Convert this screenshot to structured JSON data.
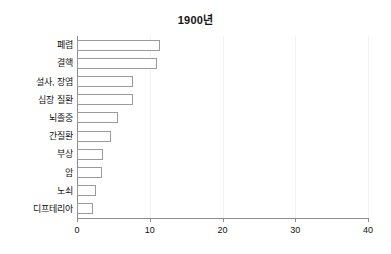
{
  "chart_data": {
    "type": "bar",
    "orientation": "horizontal",
    "title": "1900년",
    "xlabel": "",
    "ylabel": "",
    "categories": [
      "폐렴",
      "결핵",
      "설사, 장염",
      "심장 질환",
      "뇌졸중",
      "간질환",
      "부상",
      "암",
      "노쇠",
      "디프테리아"
    ],
    "values": [
      11.4,
      11.0,
      7.7,
      7.7,
      5.6,
      4.7,
      3.6,
      3.4,
      2.6,
      2.2
    ],
    "xlim": [
      0,
      40
    ],
    "xticks": [
      "0",
      "10",
      "20",
      "30",
      "40"
    ],
    "xtick_values": [
      0,
      10,
      20,
      30,
      40
    ],
    "grid": true,
    "legend": false,
    "bar_fill_color": "#ffffff",
    "bar_edge_color": "#9a9a9a",
    "axis_color": "#8c8c8c",
    "text_color": "#111111"
  }
}
